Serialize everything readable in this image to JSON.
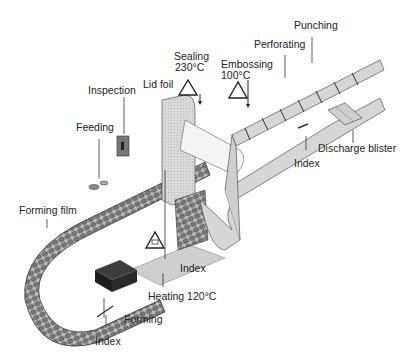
{
  "diagram": {
    "labels": {
      "punching": "Punching",
      "perforating": "Perforating",
      "sealing": "Sealing",
      "sealing_temp": "230°C",
      "embossing": "Embossing",
      "embossing_temp": "100°C",
      "lid_foil": "Lid foil",
      "inspection": "Inspection",
      "feeding": "Feeding",
      "index_right": "Index",
      "discharge_blister": "Discharge blister",
      "forming_film": "Forming film",
      "index_middle": "Index",
      "heating": "Heating 120°C",
      "forming": "Forming",
      "index_bottom": "Index"
    },
    "colors": {
      "film": "#d6d6d6",
      "film_dark": "#555555",
      "forming_block": "#2a2a2a",
      "heater_plate": "#cfcfcf",
      "outline": "#444444"
    }
  }
}
